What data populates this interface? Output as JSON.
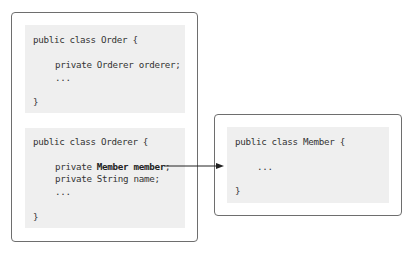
{
  "classes": {
    "order": {
      "header": "public class Order {",
      "fields": [
        "private Orderer orderer;",
        "..."
      ],
      "close": "}"
    },
    "orderer": {
      "header": "public class Orderer {",
      "field1_prefix": "private ",
      "field1_bold": "Member member",
      "field1_suffix": ";",
      "field2": "private String name;",
      "ellipsis": "...",
      "close": "}"
    },
    "member": {
      "header": "public class Member {",
      "ellipsis": "...",
      "close": "}"
    }
  },
  "arrow": {
    "from": "Orderer.member",
    "to": "Member"
  }
}
